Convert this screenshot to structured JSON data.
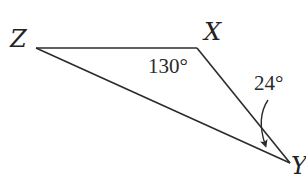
{
  "diagram": {
    "type": "triangle",
    "vertices": {
      "Z": {
        "label": "Z",
        "x": 36,
        "y": 48
      },
      "X": {
        "label": "X",
        "x": 197,
        "y": 48
      },
      "Y": {
        "label": "Y",
        "x": 290,
        "y": 163
      }
    },
    "angles": {
      "X": {
        "label": "130°"
      },
      "Y": {
        "label": "24°"
      }
    },
    "colors": {
      "line": "#2b2b2b",
      "text": "#222222",
      "background": "#ffffff"
    }
  }
}
